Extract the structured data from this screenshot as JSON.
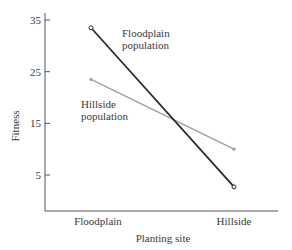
{
  "chart_data": {
    "type": "line",
    "title": "",
    "xlabel": "Planting site",
    "ylabel": "Fitness",
    "categories": [
      "Floodplain",
      "Hillside"
    ],
    "yticks": [
      5,
      15,
      25,
      35
    ],
    "ylim": [
      0,
      37
    ],
    "grid": false,
    "legend": "inline annotations",
    "series": [
      {
        "name": "Floodplain population",
        "label_lines": [
          "Floodplain",
          "population"
        ],
        "values": [
          33.5,
          2.7
        ],
        "color": "#2b2b2b",
        "marker": "open-circle"
      },
      {
        "name": "Hillside population",
        "label_lines": [
          "Hillside",
          "population"
        ],
        "values": [
          23.5,
          10.0
        ],
        "color": "#a0a0a0",
        "marker": "small-dot"
      }
    ]
  }
}
